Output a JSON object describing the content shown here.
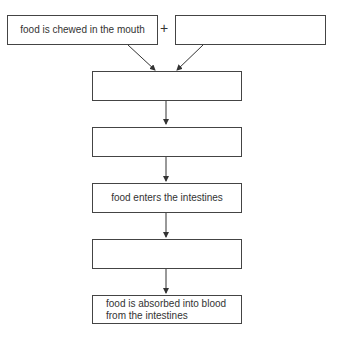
{
  "diagram": {
    "type": "flowchart",
    "colors": {
      "stroke": "#444444",
      "text": "#333333",
      "background": "#ffffff"
    },
    "operator": "+",
    "boxes": [
      {
        "id": "box1",
        "label": "food is chewed in the mouth"
      },
      {
        "id": "box2",
        "label": ""
      },
      {
        "id": "box3",
        "label": ""
      },
      {
        "id": "box4",
        "label": ""
      },
      {
        "id": "box5",
        "label": "food enters the intestines"
      },
      {
        "id": "box6",
        "label": ""
      },
      {
        "id": "box7",
        "label": "food is absorbed into blood from the intestines"
      }
    ],
    "edges": [
      {
        "from": "box1",
        "to": "box3"
      },
      {
        "from": "box2",
        "to": "box3"
      },
      {
        "from": "box3",
        "to": "box4"
      },
      {
        "from": "box4",
        "to": "box5"
      },
      {
        "from": "box5",
        "to": "box6"
      },
      {
        "from": "box6",
        "to": "box7"
      }
    ]
  }
}
